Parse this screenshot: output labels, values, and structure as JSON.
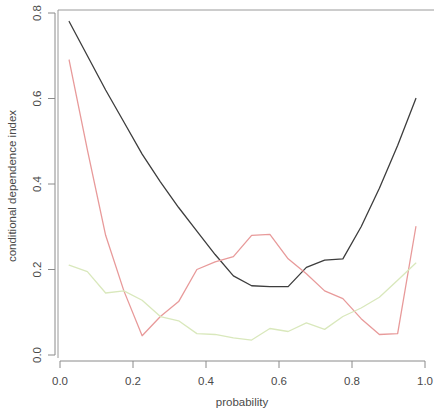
{
  "chart_data": {
    "type": "line",
    "title": "",
    "xlabel": "probability",
    "ylabel": "conditional dependence index",
    "xlim": [
      0.0,
      1.0
    ],
    "ylim": [
      0.0,
      0.8
    ],
    "xticks": [
      "0.0",
      "0.2",
      "0.4",
      "0.6",
      "0.8",
      "1.0"
    ],
    "xtick_values": [
      0.0,
      0.2,
      0.4,
      0.6,
      0.8,
      1.0
    ],
    "yticks": [
      "0.0",
      "0.2",
      "0.4",
      "0.6",
      "0.8"
    ],
    "ytick_values": [
      0.0,
      0.2,
      0.4,
      0.6,
      0.8
    ],
    "grid": false,
    "legend": "none",
    "colors": {
      "series1": "#3d3d3d",
      "series2": "#e89a9a",
      "series3": "#d9e8bc",
      "axis": "#8a8a8a",
      "frame": "#9a9a9a",
      "background": "#ffffff"
    },
    "series": [
      {
        "name": "black-curve",
        "color": "#3d3d3d",
        "x": [
          0.025,
          0.075,
          0.125,
          0.175,
          0.225,
          0.275,
          0.325,
          0.375,
          0.425,
          0.475,
          0.525,
          0.575,
          0.625,
          0.675,
          0.725,
          0.775,
          0.825,
          0.875,
          0.925,
          0.975
        ],
        "y": [
          0.78,
          0.7,
          0.62,
          0.545,
          0.47,
          0.405,
          0.345,
          0.29,
          0.235,
          0.185,
          0.162,
          0.16,
          0.16,
          0.205,
          0.222,
          0.225,
          0.3,
          0.39,
          0.49,
          0.6
        ]
      },
      {
        "name": "red-curve",
        "color": "#e89a9a",
        "x": [
          0.025,
          0.075,
          0.125,
          0.175,
          0.225,
          0.275,
          0.325,
          0.375,
          0.425,
          0.475,
          0.525,
          0.575,
          0.625,
          0.675,
          0.725,
          0.775,
          0.825,
          0.875,
          0.925,
          0.975
        ],
        "y": [
          0.69,
          0.48,
          0.28,
          0.15,
          0.045,
          0.09,
          0.125,
          0.2,
          0.218,
          0.23,
          0.28,
          0.282,
          0.225,
          0.19,
          0.15,
          0.132,
          0.085,
          0.048,
          0.05,
          0.3
        ]
      },
      {
        "name": "green-curve",
        "color": "#d9e8bc",
        "x": [
          0.025,
          0.075,
          0.125,
          0.175,
          0.225,
          0.275,
          0.325,
          0.375,
          0.425,
          0.475,
          0.525,
          0.575,
          0.625,
          0.675,
          0.725,
          0.775,
          0.825,
          0.875,
          0.925,
          0.975
        ],
        "y": [
          0.21,
          0.195,
          0.145,
          0.15,
          0.128,
          0.09,
          0.08,
          0.05,
          0.048,
          0.04,
          0.035,
          0.062,
          0.055,
          0.075,
          0.06,
          0.09,
          0.11,
          0.135,
          0.175,
          0.215
        ]
      }
    ],
    "series_endpoints": {
      "black_end": 0.68,
      "red_end": 0.54,
      "green_end": 0.3
    }
  }
}
